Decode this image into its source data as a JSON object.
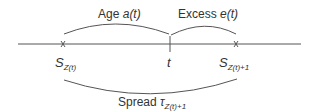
{
  "diagram": {
    "labels": {
      "age_word": "Age",
      "age_sym": "a(t)",
      "excess_word": "Excess",
      "excess_sym": "e(t)",
      "s_left_main": "S",
      "s_left_sub": "Z(t)",
      "t_label": "t",
      "s_right_main": "S",
      "s_right_sub": "Z(t)+1",
      "spread_word": "Spread",
      "spread_sym": "τ",
      "spread_sub": "Z(t)+1"
    },
    "markers": {
      "left_event": "x",
      "right_event": "x"
    },
    "colors": {
      "line": "#444444",
      "text": "#333333"
    }
  }
}
